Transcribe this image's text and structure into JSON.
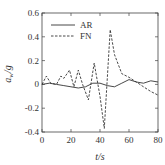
{
  "chart_data": {
    "type": "line",
    "title": "",
    "xlabel": "t/s",
    "ylabel": "a_w/g",
    "xlim": [
      0,
      80
    ],
    "ylim": [
      -0.4,
      0.6
    ],
    "xticks": [
      0,
      20,
      40,
      60,
      80
    ],
    "yticks": [
      -0.4,
      -0.2,
      0,
      0.2,
      0.4,
      0.6
    ],
    "xtick_labels": [
      "0",
      "20",
      "40",
      "60",
      "80"
    ],
    "ytick_labels": [
      "-0.4",
      "-0.2",
      "0",
      "0.2",
      "0.4",
      "0.6"
    ],
    "grid": false,
    "legend_position": "upper left",
    "series": [
      {
        "name": "AR",
        "style": "solid",
        "color": "#333333",
        "x": [
          0,
          5,
          10,
          15,
          20,
          25,
          30,
          35,
          40,
          45,
          50,
          55,
          60,
          65,
          70,
          75,
          80
        ],
        "values": [
          0.0,
          0.01,
          0.0,
          -0.01,
          -0.02,
          -0.03,
          -0.02,
          0.01,
          0.01,
          -0.01,
          -0.02,
          0.01,
          0.04,
          0.02,
          0.01,
          0.03,
          0.02
        ]
      },
      {
        "name": "FN",
        "style": "dashed",
        "color": "#333333",
        "x": [
          0,
          3,
          6,
          10,
          13,
          15,
          19,
          22,
          25,
          28,
          32,
          36,
          40,
          43,
          47,
          50,
          55,
          60,
          65,
          70,
          75,
          80
        ],
        "values": [
          0.0,
          0.07,
          0.01,
          0.0,
          0.07,
          0.05,
          0.12,
          -0.02,
          0.12,
          0.0,
          -0.13,
          0.18,
          -0.1,
          -0.37,
          0.46,
          0.25,
          0.09,
          0.06,
          0.02,
          -0.02,
          -0.06,
          -0.09
        ]
      }
    ]
  }
}
